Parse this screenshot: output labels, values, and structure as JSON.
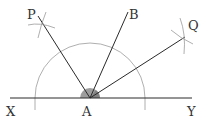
{
  "diagram": {
    "colors": {
      "line": "#2a2a2a",
      "construction": "#9a9a9a",
      "angle_fill": "#8c8c8c",
      "background": "#ffffff"
    },
    "points": {
      "X": {
        "label": "X",
        "x": 10,
        "y": 98
      },
      "Y": {
        "label": "Y",
        "x": 192,
        "y": 98
      },
      "A": {
        "label": "A",
        "x": 90,
        "y": 98
      },
      "P": {
        "label": "P",
        "x": 38,
        "y": 16
      },
      "B": {
        "label": "B",
        "x": 128,
        "y": 12
      },
      "Q": {
        "label": "Q",
        "x": 185,
        "y": 37
      }
    },
    "segments": [
      {
        "from": "X",
        "to": "Y",
        "name": "line-xy"
      },
      {
        "from": "A",
        "to": "P",
        "name": "ray-ap"
      },
      {
        "from": "A",
        "to": "B",
        "name": "ray-ab"
      },
      {
        "from": "A",
        "to": "Q",
        "name": "ray-aq"
      }
    ],
    "arc": {
      "center": "A",
      "radius": 55
    },
    "labels": {
      "X": "X",
      "Y": "Y",
      "A": "A",
      "P": "P",
      "B": "B",
      "Q": "Q"
    }
  }
}
